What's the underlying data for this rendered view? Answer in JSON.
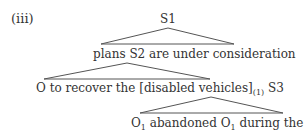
{
  "example_label": "(iii)",
  "tree": {
    "root": "S1",
    "level1": {
      "text": "plans S2 are under consideration"
    },
    "level2": {
      "pre": "O to recover the [disabled vehicles]",
      "sub": "(1)",
      "post": " S3"
    },
    "level3": {
      "o1": "O",
      "o1_sub": "1",
      "mid": " abandoned O",
      "o2_sub": "1",
      "post": " during the night"
    }
  },
  "colors": {
    "text": "#333333",
    "lines": "#555555"
  }
}
